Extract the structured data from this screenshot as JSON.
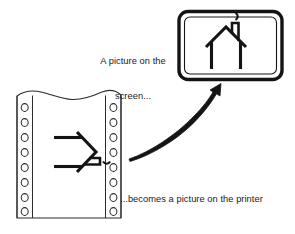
{
  "figure": {
    "background_color": "#ffffff",
    "ink_color": "#1a1a1a",
    "width": 295,
    "height": 234
  },
  "captions": {
    "screen": {
      "line1": "A picture on the",
      "line2": "screen...",
      "full": "A picture on the screen..."
    },
    "printer": {
      "line1": "...becomes a picture on the printer",
      "full": "...becomes a picture on the printer"
    }
  },
  "monitor": {
    "label": "computer-monitor",
    "bezel_color": "#141414",
    "screen_color": "#ffffff",
    "content": "house-drawing"
  },
  "screen_house": {
    "label": "house-drawing-upright",
    "parts": [
      "roof",
      "left-wall",
      "right-wall",
      "chimney",
      "smoke"
    ]
  },
  "printer_paper": {
    "label": "continuous-tractor-feed-paper",
    "paper_color": "#ffffff",
    "edge_color": "#2b2b2b",
    "sprocket_holes_left": 8,
    "sprocket_holes_right": 8,
    "top_edge": "torn-wavy",
    "content": "house-drawing-rotated"
  },
  "printed_house": {
    "label": "house-drawing-rotated-90",
    "parts": [
      "roof",
      "left-wall",
      "right-wall",
      "chimney",
      "smoke"
    ]
  },
  "arrow": {
    "label": "curved-arrow-paper-to-screen",
    "direction": "up-right",
    "style": "tapered-curved-outline",
    "color": "#141414"
  }
}
